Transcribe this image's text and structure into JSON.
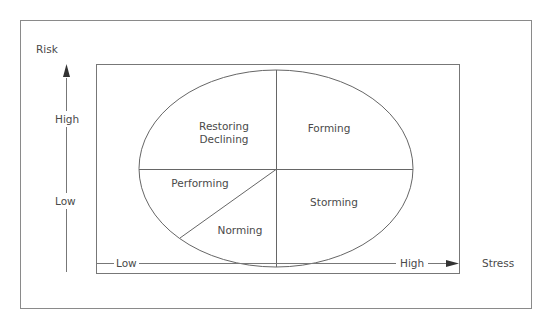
{
  "diagram": {
    "y_axis": {
      "title": "Risk",
      "high_label": "High",
      "low_label": "Low"
    },
    "x_axis": {
      "title": "Stress",
      "low_label": "Low",
      "high_label": "High"
    },
    "segments": [
      {
        "id": "restoring-declining",
        "line1": "Restoring",
        "line2": "Declining"
      },
      {
        "id": "forming",
        "label": "Forming"
      },
      {
        "id": "performing",
        "label": "Performing"
      },
      {
        "id": "norming",
        "label": "Norming"
      },
      {
        "id": "storming",
        "label": "Storming"
      }
    ],
    "colors": {
      "line": "#6b6b6b",
      "text": "#4a4a4a",
      "background": "#ffffff"
    }
  }
}
